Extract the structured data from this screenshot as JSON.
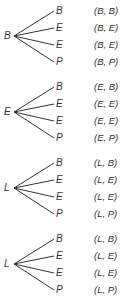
{
  "trees": [
    {
      "root": "B",
      "leaves": [
        "B",
        "E",
        "E",
        "P"
      ],
      "outcomes": [
        "(B, B)",
        "(B, E)",
        "(B, E)",
        "(B, P)"
      ]
    },
    {
      "root": "E",
      "leaves": [
        "B",
        "E",
        "E",
        "P"
      ],
      "outcomes": [
        "(E, B)",
        "(E, E)",
        "(E, E)",
        "(E, P)"
      ]
    },
    {
      "root": "L",
      "leaves": [
        "B",
        "E",
        "E",
        "P"
      ],
      "outcomes": [
        "(L, B)",
        "(L, E)",
        "(L, E)",
        "(L, P)"
      ]
    },
    {
      "root": "L",
      "leaves": [
        "B",
        "E",
        "E",
        "P"
      ],
      "outcomes": [
        "(L, B)",
        "(L, E)",
        "(L, E)",
        "(L, P)"
      ]
    }
  ]
}
